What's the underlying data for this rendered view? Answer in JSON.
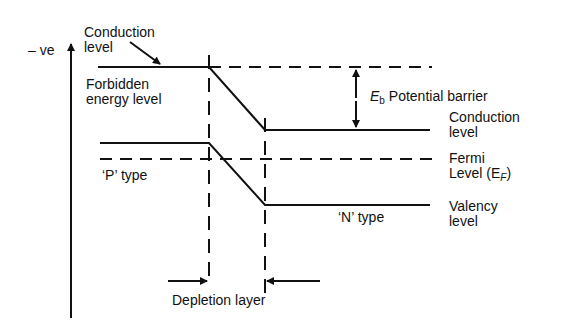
{
  "diagram": {
    "axis": {
      "label": "– ve"
    },
    "labels": {
      "conduction_left": [
        "Conduction",
        "level"
      ],
      "forbidden": [
        "Forbidden",
        "energy level"
      ],
      "p_type": "‘P’ type",
      "potential_barrier_symbol": "E",
      "potential_barrier_sub": "b",
      "potential_barrier": "Potential barrier",
      "conduction_right": [
        "Conduction",
        "level"
      ],
      "fermi": [
        "Fermi",
        "Level (E",
        "F",
        ")"
      ],
      "n_type": "‘N’ type",
      "valency": [
        "Valency",
        "level"
      ],
      "depletion": "Depletion layer"
    },
    "colors": {
      "line": "#111111",
      "background": "#ffffff"
    }
  }
}
